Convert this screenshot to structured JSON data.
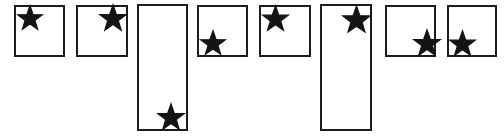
{
  "canvas": {
    "width": 504,
    "height": 136,
    "background_color": "#ffffff",
    "description": "Eight outlined rectangles on a white background, each containing a single black five-pointed star placed in a different corner region"
  },
  "style": {
    "box_border_color": "#1c1c1c",
    "box_border_width": 2,
    "box_fill_color": "#ffffff",
    "star_fill_color": "#141414"
  },
  "shapes": [
    {
      "id": "box-1",
      "shape": "square",
      "x": 14,
      "y": 5,
      "width": 51,
      "height": 52,
      "star": {
        "name": "star-icon",
        "position_label": "top-left",
        "center_x": 30,
        "center_y": 18,
        "size": 26,
        "points": 5
      }
    },
    {
      "id": "box-2",
      "shape": "square",
      "x": 76,
      "y": 5,
      "width": 52,
      "height": 52,
      "star": {
        "name": "star-icon",
        "position_label": "top-right",
        "center_x": 113,
        "center_y": 18,
        "size": 28,
        "points": 5
      }
    },
    {
      "id": "box-3",
      "shape": "tall-rectangle",
      "x": 137,
      "y": 4,
      "width": 51,
      "height": 127,
      "star": {
        "name": "star-icon",
        "position_label": "bottom-center-right",
        "center_x": 171,
        "center_y": 117,
        "size": 28,
        "points": 5
      }
    },
    {
      "id": "box-4",
      "shape": "square",
      "x": 197,
      "y": 5,
      "width": 51,
      "height": 52,
      "star": {
        "name": "star-icon",
        "position_label": "bottom-left",
        "center_x": 213,
        "center_y": 43,
        "size": 26,
        "points": 5
      }
    },
    {
      "id": "box-5",
      "shape": "square",
      "x": 259,
      "y": 5,
      "width": 52,
      "height": 52,
      "star": {
        "name": "star-icon",
        "position_label": "top-left",
        "center_x": 275,
        "center_y": 18,
        "size": 27,
        "points": 5
      }
    },
    {
      "id": "box-6",
      "shape": "tall-rectangle",
      "x": 320,
      "y": 4,
      "width": 52,
      "height": 127,
      "star": {
        "name": "star-icon",
        "position_label": "top-right",
        "center_x": 356,
        "center_y": 19,
        "size": 29,
        "points": 5
      }
    },
    {
      "id": "box-7",
      "shape": "square",
      "x": 385,
      "y": 5,
      "width": 51,
      "height": 52,
      "star": {
        "name": "star-icon",
        "position_label": "bottom-right",
        "center_x": 427,
        "center_y": 43,
        "size": 28,
        "points": 5
      }
    },
    {
      "id": "box-8",
      "shape": "square",
      "x": 447,
      "y": 5,
      "width": 50,
      "height": 52,
      "star": {
        "name": "star-icon",
        "position_label": "bottom-left",
        "center_x": 462,
        "center_y": 43,
        "size": 27,
        "points": 5
      }
    }
  ]
}
